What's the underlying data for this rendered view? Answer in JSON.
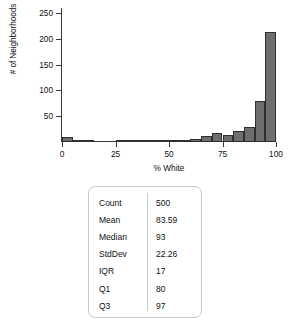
{
  "chart_data": {
    "type": "bar",
    "title": "",
    "xlabel": "% White",
    "ylabel": "# of Neighborhoods",
    "xlim": [
      0,
      100
    ],
    "ylim": [
      0,
      260
    ],
    "grid": false,
    "legend": "none",
    "bin_width": 5,
    "bar_color": "#6e6e6e",
    "bar_edge_color": "#2f2f2f",
    "categories": [
      "0-5",
      "5-10",
      "10-15",
      "15-20",
      "20-25",
      "25-30",
      "30-35",
      "35-40",
      "40-45",
      "45-50",
      "50-55",
      "55-60",
      "60-65",
      "65-70",
      "70-75",
      "75-80",
      "80-85",
      "85-90",
      "90-95",
      "95-100"
    ],
    "bin_starts": [
      0,
      5,
      10,
      15,
      20,
      25,
      30,
      35,
      40,
      45,
      50,
      55,
      60,
      65,
      70,
      75,
      80,
      85,
      90,
      95
    ],
    "values": [
      9,
      2,
      4,
      0,
      0,
      2,
      2,
      1,
      1,
      2,
      3,
      2,
      6,
      11,
      17,
      14,
      21,
      29,
      80,
      213
    ],
    "xticks": [
      0,
      25,
      50,
      75,
      100
    ],
    "xtick_labels": [
      "0",
      "25",
      "50",
      "75",
      "100"
    ],
    "yticks": [
      50,
      100,
      150,
      200,
      250
    ],
    "ytick_labels": [
      "50",
      "100",
      "150",
      "200",
      "250"
    ]
  },
  "stats": {
    "rows": [
      {
        "label": "Count",
        "value": "500"
      },
      {
        "label": "Mean",
        "value": "83.59"
      },
      {
        "label": "Median",
        "value": "93"
      },
      {
        "label": "StdDev",
        "value": "22.26"
      },
      {
        "label": "IQR",
        "value": "17"
      },
      {
        "label": "Q1",
        "value": "80"
      },
      {
        "label": "Q3",
        "value": "97"
      }
    ]
  }
}
